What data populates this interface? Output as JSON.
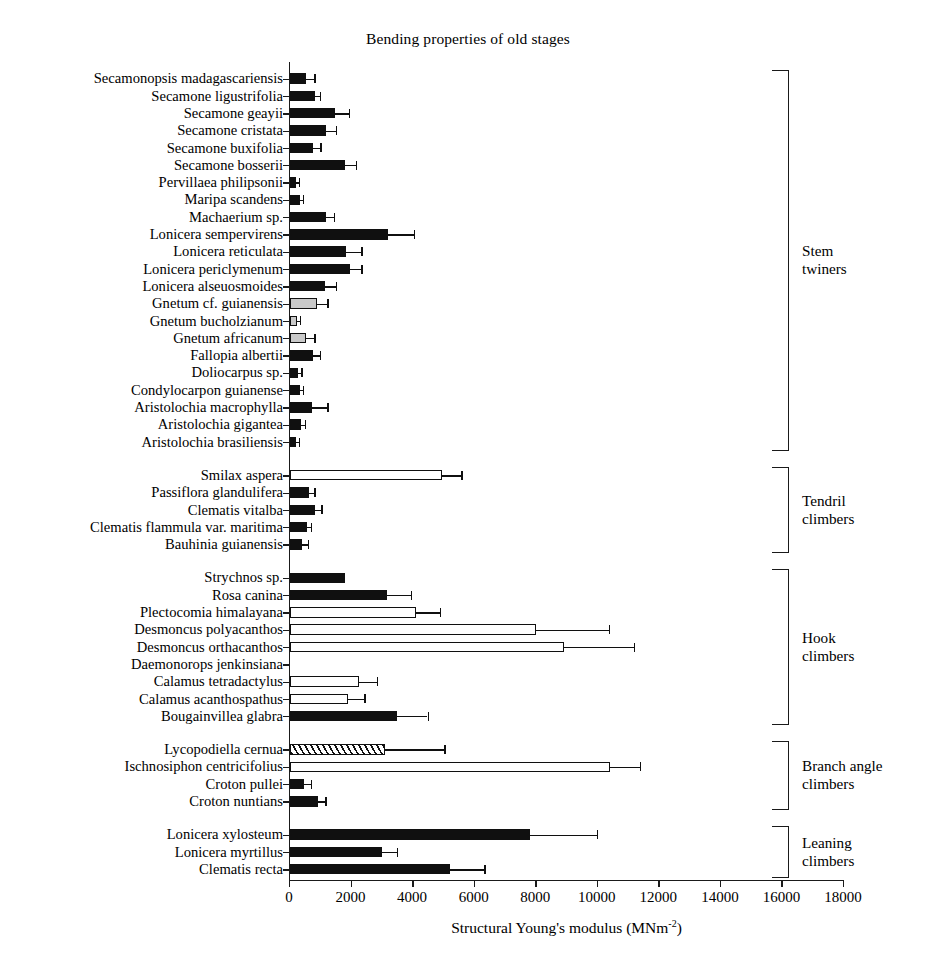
{
  "chart_data": {
    "type": "bar",
    "orientation": "horizontal",
    "title": "Bending properties of old stages",
    "xlabel_text": "Structural Young's modulus (MNm",
    "xlabel_sup": "-2",
    "xlabel_tail": ")",
    "ylabel": "",
    "xlim": [
      0,
      18000
    ],
    "xticks": [
      0,
      2000,
      4000,
      6000,
      8000,
      10000,
      12000,
      14000,
      16000,
      18000
    ],
    "xtick_labels": [
      "0",
      "2000",
      "4000",
      "6000",
      "8000",
      "10000",
      "12000",
      "14000",
      "16000",
      "18000"
    ],
    "grid": false,
    "legend": "none",
    "fill_styles": {
      "solid": "#101010",
      "white": "#ffffff",
      "gray": "#c9c9c9",
      "hatch": "diagonal-hatch"
    },
    "groups": [
      {
        "name": "Stem twiners",
        "label": "Stem\ntwiners",
        "categories": [
          "Secamonopsis madagascariensis",
          "Secamone ligustrifolia",
          "Secamone geayii",
          "Secamone cristata",
          "Secamone buxifolia",
          "Secamone bosserii",
          "Pervillaea philipsonii",
          "Maripa scandens",
          "Machaerium sp.",
          "Lonicera sempervirens",
          "Lonicera reticulata",
          "Lonicera periclymenum",
          "Lonicera alseuosmoides",
          "Gnetum cf. guianensis",
          "Gnetum bucholzianum",
          "Gnetum africanum",
          "Fallopia albertii",
          "Doliocarpus sp.",
          "Condylocarpon guianense",
          "Aristolochia macrophylla",
          "Aristolochia gigantea",
          "Aristolochia brasiliensis"
        ],
        "values": [
          520,
          800,
          1450,
          1180,
          760,
          1780,
          190,
          330,
          1180,
          3200,
          1820,
          1950,
          1150,
          880,
          230,
          520,
          760,
          260,
          330,
          720,
          360,
          190
        ],
        "errors": [
          820,
          1000,
          1950,
          1520,
          1020,
          2180,
          330,
          460,
          1450,
          4050,
          2350,
          2350,
          1520,
          1250,
          360,
          820,
          1000,
          400,
          460,
          1250,
          520,
          330
        ],
        "fills": [
          "solid",
          "solid",
          "solid",
          "solid",
          "solid",
          "solid",
          "solid",
          "solid",
          "solid",
          "solid",
          "solid",
          "solid",
          "solid",
          "gray",
          "gray",
          "gray",
          "solid",
          "solid",
          "solid",
          "solid",
          "solid",
          "solid"
        ]
      },
      {
        "name": "Tendril climbers",
        "label": "Tendril\nclimbers",
        "categories": [
          "Smilax aspera",
          "Passiflora glandulifera",
          "Clematis vitalba",
          "Clematis flammula var. maritima",
          "Bauhinia guianensis"
        ],
        "values": [
          4950,
          620,
          800,
          560,
          400
        ],
        "errors": [
          5600,
          820,
          1050,
          720,
          620
        ],
        "fills": [
          "white",
          "solid",
          "solid",
          "solid",
          "solid"
        ]
      },
      {
        "name": "Hook climbers",
        "label": "Hook\nclimbers",
        "categories": [
          "Strychnos sp.",
          "Rosa canina",
          "Plectocomia himalayana",
          "Desmoncus polyacanthos",
          "Desmoncus orthacanthos",
          "Daemonorops jenkinsiana",
          "Calamus tetradactylus",
          "Calamus acanthospathus",
          "Bougainvillea glabra"
        ],
        "values": [
          1780,
          3150,
          4100,
          8000,
          8900,
          0,
          2250,
          1880,
          3480
        ],
        "errors": [
          1780,
          3950,
          4900,
          10400,
          11200,
          0,
          2850,
          2450,
          4500
        ],
        "fills": [
          "solid",
          "solid",
          "white",
          "white",
          "white",
          "white",
          "white",
          "white",
          "solid"
        ]
      },
      {
        "name": "Branch angle climbers",
        "label": "Branch angle\nclimbers",
        "categories": [
          "Lycopodiella cernua",
          "Ischnosiphon centricifolius",
          "Croton pullei",
          "Croton nuntians"
        ],
        "values": [
          3080,
          10400,
          440,
          900
        ],
        "errors": [
          5050,
          11400,
          700,
          1180
        ],
        "fills": [
          "hatch",
          "white",
          "solid",
          "solid"
        ]
      },
      {
        "name": "Leaning climbers",
        "label": "Leaning\nclimbers",
        "categories": [
          "Lonicera xylosteum",
          "Lonicera myrtillus",
          "Clematis recta"
        ],
        "values": [
          7800,
          3000,
          5200
        ],
        "errors": [
          10000,
          3500,
          6350
        ],
        "fills": [
          "solid",
          "solid",
          "solid"
        ]
      }
    ]
  }
}
